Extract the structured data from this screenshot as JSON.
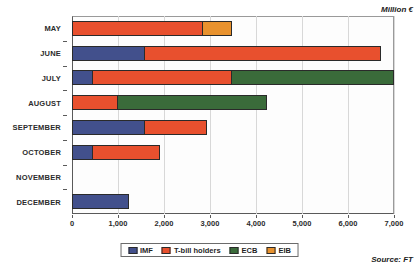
{
  "chart_data": {
    "type": "bar",
    "orientation": "horizontal",
    "stacked": true,
    "title": "",
    "xlabel": "",
    "ylabel": "",
    "xlim": [
      0,
      7000
    ],
    "xticks": [
      0,
      1000,
      2000,
      3000,
      4000,
      5000,
      6000,
      7000
    ],
    "xtick_labels": [
      "0",
      "1,000",
      "2,000",
      "3,000",
      "4,000",
      "5,000",
      "6,000",
      "7,000"
    ],
    "grid": true,
    "grid_axis": "x",
    "legend_position": "bottom",
    "categories": [
      "MAY",
      "JUNE",
      "JULY",
      "AUGUST",
      "SEPTEMBER",
      "OCTOBER",
      "NOVEMBER",
      "DECEMBER"
    ],
    "series": [
      {
        "name": "IMF",
        "color": "#42508c",
        "values": [
          0,
          1580,
          460,
          0,
          1580,
          460,
          0,
          1240
        ]
      },
      {
        "name": "T-bill holders",
        "color": "#e8502e",
        "values": [
          2850,
          5150,
          3060,
          1000,
          1370,
          1480,
          0,
          0
        ]
      },
      {
        "name": "ECB",
        "color": "#3a6b3a",
        "values": [
          0,
          0,
          3560,
          3250,
          0,
          0,
          0,
          0
        ]
      },
      {
        "name": "EIB",
        "color": "#e8922e",
        "values": [
          650,
          0,
          0,
          0,
          0,
          0,
          0,
          0
        ]
      }
    ],
    "totals": [
      3500,
      6730,
      7080,
      4250,
      2950,
      1940,
      0,
      1240
    ],
    "annotations": {
      "units": "Million €",
      "source": "Source: FT"
    }
  },
  "legend": {
    "items": [
      {
        "label": "IMF",
        "color": "#42508c"
      },
      {
        "label": "T-bill holders",
        "color": "#e8502e"
      },
      {
        "label": "ECB",
        "color": "#3a6b3a"
      },
      {
        "label": "EIB",
        "color": "#e8922e"
      }
    ]
  }
}
